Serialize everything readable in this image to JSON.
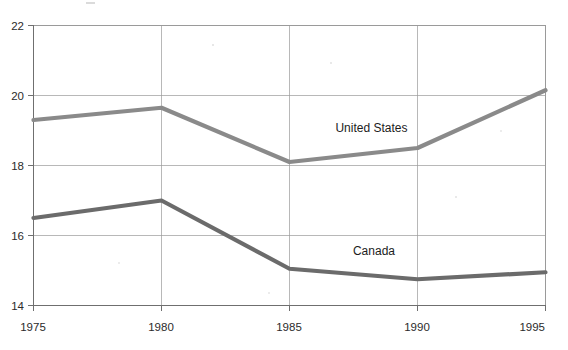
{
  "chart_data": {
    "type": "line",
    "title": "",
    "subtitle": "",
    "xlabel": "",
    "ylabel": "",
    "x": [
      1975,
      1980,
      1985,
      1990,
      1995
    ],
    "categories": [
      "1975",
      "1980",
      "1985",
      "1990",
      "1995"
    ],
    "xtick_labels": [
      "1975",
      "1980",
      "1985",
      "1990",
      "1995"
    ],
    "ytick_labels": [
      "22",
      "20",
      "18",
      "16",
      "14"
    ],
    "yticks": [
      22,
      20,
      18,
      16,
      14
    ],
    "ylim": [
      14,
      22
    ],
    "xlim": [
      1975,
      1995
    ],
    "grid": true,
    "legend_position": "inline-annotation",
    "series": [
      {
        "name": "United States",
        "label": "United States",
        "color": "#8a8a8a",
        "values": [
          19.3,
          19.65,
          18.1,
          18.5,
          20.15
        ]
      },
      {
        "name": "Canada",
        "label": "Canada",
        "color": "#6b6b6b",
        "values": [
          16.5,
          17.0,
          15.05,
          14.75,
          14.95
        ]
      }
    ],
    "annotations": [
      {
        "text": "United States",
        "x": 1988.2,
        "y": 18.95
      },
      {
        "text": "Canada",
        "x": 1988.3,
        "y": 15.45
      }
    ]
  },
  "colors": {
    "background": "#ffffff",
    "grid": "#9a9a9a",
    "axis": "#6f6f6f",
    "text": "#2b2b2b",
    "series_us": "#8a8a8a",
    "series_canada": "#6b6b6b"
  }
}
